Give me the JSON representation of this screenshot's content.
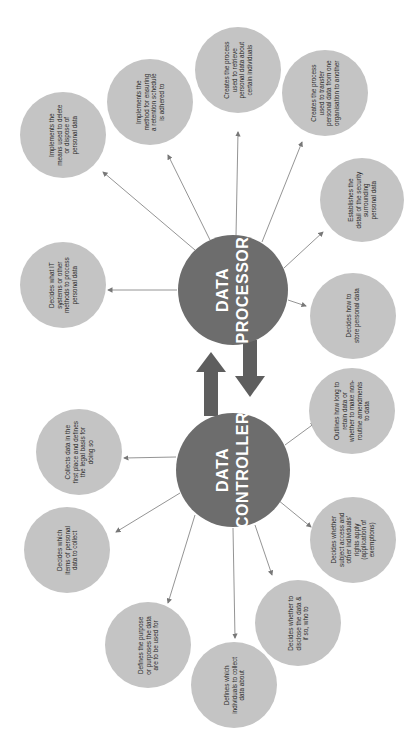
{
  "diagram": {
    "orientation": "rotated-90-ccw",
    "colors": {
      "major_node": "#6d6d6d",
      "minor_node": "#c4c4c4",
      "line": "#777777",
      "arrow": "#5e5e5e",
      "background": "#ffffff"
    },
    "processor": {
      "label_1": "DATA",
      "label_2": "PROCESSOR"
    },
    "controller": {
      "label_1": "DATA",
      "label_2": "CONTROLLER"
    },
    "processor_nodes": [
      {
        "text": "Implements the means used to delete or dispose of personal data"
      },
      {
        "text": "Implements the method for ensuring a retention schedule is adhered to"
      },
      {
        "text": "Creates the process used to retrieve personal data about certain individuals"
      },
      {
        "text": "Creates the process used to transfer personal data from one organisation to another"
      },
      {
        "text": "Establishes the detail of the security surrounding personal data"
      },
      {
        "text": "Decides how to store personal data"
      },
      {
        "text": "Decides what IT systems or other methods to process personal data"
      }
    ],
    "controller_nodes": [
      {
        "text": "Outlines how long to retain data or whether to make non-routine amendments to data"
      },
      {
        "text": "Decides whether subject access and other individuals' rights apply (application of exemptions)"
      },
      {
        "text": "Decides whether to disclose the data & if so, who to"
      },
      {
        "text": "Defines which individuals to collect data about"
      },
      {
        "text": "Defines the purpose or purposes the data are to be used for"
      },
      {
        "text": "Decides which items of personal data to collect"
      },
      {
        "text": "Collects data in the first place and defines the legal basis for doing so"
      }
    ]
  }
}
